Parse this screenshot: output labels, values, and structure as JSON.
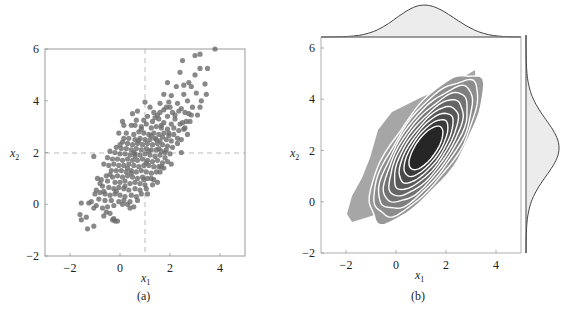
{
  "chart_data": [
    {
      "id": "a",
      "type": "scatter",
      "caption": "(a)",
      "xlabel": "x1",
      "ylabel": "x2",
      "xlim": [
        -3,
        5
      ],
      "ylim": [
        -2,
        6
      ],
      "xticks": [
        -2,
        0,
        2,
        4
      ],
      "yticks": [
        -2,
        0,
        2,
        4,
        6
      ],
      "grid": false,
      "reference_lines": {
        "vertical_x": 1,
        "horizontal_y": 2,
        "style": "dashed"
      },
      "marker_color": "#6b6b6b",
      "points": [
        [
          3.8,
          6.0
        ],
        [
          3.2,
          5.8
        ],
        [
          3.0,
          5.75
        ],
        [
          2.5,
          5.55
        ],
        [
          3.5,
          5.25
        ],
        [
          3.2,
          5.25
        ],
        [
          3.0,
          5.0
        ],
        [
          2.4,
          5.1
        ],
        [
          1.9,
          4.7
        ],
        [
          3.4,
          4.65
        ],
        [
          2.75,
          4.7
        ],
        [
          2.85,
          4.55
        ],
        [
          2.55,
          4.6
        ],
        [
          2.25,
          4.55
        ],
        [
          1.75,
          4.25
        ],
        [
          2.55,
          4.25
        ],
        [
          3.05,
          4.3
        ],
        [
          3.45,
          4.25
        ],
        [
          2.05,
          4.2
        ],
        [
          1.0,
          3.95
        ],
        [
          1.6,
          3.9
        ],
        [
          1.95,
          3.95
        ],
        [
          2.3,
          3.9
        ],
        [
          2.7,
          4.0
        ],
        [
          2.0,
          3.75
        ],
        [
          1.75,
          3.65
        ],
        [
          1.2,
          3.75
        ],
        [
          3.2,
          3.75
        ],
        [
          2.45,
          3.7
        ],
        [
          2.9,
          3.75
        ],
        [
          0.7,
          3.6
        ],
        [
          0.5,
          3.5
        ],
        [
          1.35,
          3.55
        ],
        [
          1.5,
          3.45
        ],
        [
          2.1,
          3.55
        ],
        [
          2.6,
          3.55
        ],
        [
          2.85,
          3.45
        ],
        [
          3.1,
          3.45
        ],
        [
          1.9,
          3.4
        ],
        [
          1.1,
          3.4
        ],
        [
          0.65,
          3.25
        ],
        [
          1.3,
          3.2
        ],
        [
          1.55,
          3.3
        ],
        [
          1.75,
          3.15
        ],
        [
          2.2,
          3.3
        ],
        [
          2.4,
          3.1
        ],
        [
          2.65,
          3.2
        ],
        [
          1.05,
          3.1
        ],
        [
          0.1,
          3.2
        ],
        [
          0.15,
          3.05
        ],
        [
          0.45,
          3.05
        ],
        [
          0.85,
          3.0
        ],
        [
          1.25,
          2.95
        ],
        [
          1.45,
          3.0
        ],
        [
          1.65,
          2.95
        ],
        [
          1.9,
          2.9
        ],
        [
          2.15,
          2.95
        ],
        [
          2.35,
          2.85
        ],
        [
          2.55,
          2.9
        ],
        [
          2.7,
          2.7
        ],
        [
          -0.05,
          2.75
        ],
        [
          0.25,
          2.75
        ],
        [
          0.55,
          2.7
        ],
        [
          0.75,
          2.8
        ],
        [
          0.95,
          2.75
        ],
        [
          1.15,
          2.7
        ],
        [
          1.35,
          2.75
        ],
        [
          1.55,
          2.7
        ],
        [
          1.75,
          2.75
        ],
        [
          1.95,
          2.65
        ],
        [
          2.15,
          2.7
        ],
        [
          2.3,
          2.55
        ],
        [
          0.35,
          2.55
        ],
        [
          0.6,
          2.5
        ],
        [
          0.8,
          2.55
        ],
        [
          1.0,
          2.5
        ],
        [
          1.2,
          2.5
        ],
        [
          1.4,
          2.55
        ],
        [
          1.6,
          2.45
        ],
        [
          1.85,
          2.5
        ],
        [
          2.05,
          2.45
        ],
        [
          2.3,
          2.35
        ],
        [
          2.45,
          2.0
        ],
        [
          0.1,
          2.4
        ],
        [
          0.3,
          2.35
        ],
        [
          0.5,
          2.3
        ],
        [
          0.7,
          2.35
        ],
        [
          0.9,
          2.3
        ],
        [
          1.1,
          2.35
        ],
        [
          1.3,
          2.3
        ],
        [
          1.5,
          2.35
        ],
        [
          1.7,
          2.3
        ],
        [
          1.9,
          2.25
        ],
        [
          2.1,
          2.2
        ],
        [
          -0.15,
          2.2
        ],
        [
          0.05,
          2.15
        ],
        [
          0.25,
          2.15
        ],
        [
          0.45,
          2.1
        ],
        [
          0.65,
          2.15
        ],
        [
          0.85,
          2.1
        ],
        [
          1.05,
          2.15
        ],
        [
          1.25,
          2.1
        ],
        [
          1.45,
          2.1
        ],
        [
          1.65,
          2.05
        ],
        [
          1.85,
          2.1
        ],
        [
          2.0,
          1.95
        ],
        [
          -0.4,
          2.05
        ],
        [
          -0.2,
          2.0
        ],
        [
          0.0,
          1.95
        ],
        [
          0.2,
          1.95
        ],
        [
          0.4,
          1.9
        ],
        [
          0.6,
          1.95
        ],
        [
          0.8,
          1.9
        ],
        [
          1.0,
          1.95
        ],
        [
          1.2,
          1.9
        ],
        [
          1.4,
          1.85
        ],
        [
          1.6,
          1.9
        ],
        [
          1.8,
          1.8
        ],
        [
          -1.05,
          1.85
        ],
        [
          -0.5,
          1.8
        ],
        [
          -0.3,
          1.75
        ],
        [
          -0.1,
          1.75
        ],
        [
          0.1,
          1.7
        ],
        [
          0.3,
          1.75
        ],
        [
          0.5,
          1.7
        ],
        [
          0.7,
          1.7
        ],
        [
          0.9,
          1.75
        ],
        [
          1.1,
          1.7
        ],
        [
          1.3,
          1.65
        ],
        [
          1.5,
          1.7
        ],
        [
          1.7,
          1.6
        ],
        [
          1.9,
          1.65
        ],
        [
          2.05,
          1.55
        ],
        [
          -0.65,
          1.55
        ],
        [
          -0.45,
          1.5
        ],
        [
          -0.25,
          1.55
        ],
        [
          -0.05,
          1.5
        ],
        [
          0.15,
          1.5
        ],
        [
          0.35,
          1.55
        ],
        [
          0.55,
          1.5
        ],
        [
          0.75,
          1.45
        ],
        [
          0.95,
          1.5
        ],
        [
          1.15,
          1.5
        ],
        [
          1.35,
          1.45
        ],
        [
          1.55,
          1.45
        ],
        [
          1.75,
          1.4
        ],
        [
          1.6,
          1.25
        ],
        [
          -0.35,
          1.3
        ],
        [
          -0.15,
          1.3
        ],
        [
          0.05,
          1.3
        ],
        [
          0.25,
          1.25
        ],
        [
          0.45,
          1.3
        ],
        [
          0.65,
          1.25
        ],
        [
          0.85,
          1.3
        ],
        [
          1.05,
          1.25
        ],
        [
          1.25,
          1.2
        ],
        [
          1.45,
          1.25
        ],
        [
          -0.55,
          1.1
        ],
        [
          -0.3,
          1.05
        ],
        [
          -0.1,
          1.1
        ],
        [
          0.1,
          1.05
        ],
        [
          0.3,
          1.1
        ],
        [
          0.5,
          1.05
        ],
        [
          0.7,
          1.0
        ],
        [
          0.9,
          1.05
        ],
        [
          1.1,
          1.0
        ],
        [
          1.35,
          0.95
        ],
        [
          1.5,
          0.85
        ],
        [
          -0.75,
          0.95
        ],
        [
          -0.5,
          0.9
        ],
        [
          -0.2,
          0.85
        ],
        [
          0.0,
          0.85
        ],
        [
          0.2,
          0.9
        ],
        [
          0.4,
          0.8
        ],
        [
          0.6,
          0.85
        ],
        [
          0.8,
          0.8
        ],
        [
          1.0,
          0.75
        ],
        [
          1.3,
          0.75
        ],
        [
          -0.95,
          0.55
        ],
        [
          -0.7,
          0.7
        ],
        [
          -0.45,
          0.65
        ],
        [
          -0.25,
          0.6
        ],
        [
          -0.05,
          0.65
        ],
        [
          0.15,
          0.6
        ],
        [
          0.35,
          0.55
        ],
        [
          0.6,
          0.6
        ],
        [
          0.8,
          0.55
        ],
        [
          1.05,
          0.6
        ],
        [
          0.85,
          0.4
        ],
        [
          -1.0,
          0.4
        ],
        [
          -0.8,
          0.45
        ],
        [
          -0.6,
          0.4
        ],
        [
          -0.4,
          0.35
        ],
        [
          -0.2,
          0.4
        ],
        [
          0.0,
          0.35
        ],
        [
          0.2,
          0.3
        ],
        [
          0.45,
          0.35
        ],
        [
          0.65,
          0.3
        ],
        [
          -0.85,
          0.2
        ],
        [
          -0.6,
          0.15
        ],
        [
          -0.35,
          0.15
        ],
        [
          -0.05,
          0.1
        ],
        [
          0.15,
          0.15
        ],
        [
          0.4,
          0.1
        ],
        [
          0.55,
          -0.1
        ],
        [
          -1.55,
          0.05
        ],
        [
          -1.25,
          0.05
        ],
        [
          -1.15,
          0.1
        ],
        [
          -0.95,
          -0.05
        ],
        [
          -0.7,
          -0.15
        ],
        [
          -0.5,
          -0.1
        ],
        [
          -0.25,
          -0.05
        ],
        [
          0.1,
          0.0
        ],
        [
          0.3,
          0.0
        ],
        [
          -1.05,
          -0.15
        ],
        [
          -0.55,
          -0.3
        ],
        [
          -0.65,
          -0.45
        ],
        [
          -0.4,
          -0.35
        ],
        [
          -1.6,
          -0.4
        ],
        [
          -1.35,
          -0.5
        ],
        [
          -1.55,
          -0.6
        ],
        [
          -0.3,
          -0.6
        ],
        [
          -0.2,
          -0.65
        ],
        [
          -0.1,
          -0.65
        ],
        [
          -0.25,
          -0.55
        ],
        [
          -1.05,
          -0.85
        ],
        [
          -1.3,
          -0.95
        ],
        [
          -0.65,
          0.5
        ],
        [
          1.55,
          2.15
        ],
        [
          1.95,
          2.75
        ],
        [
          2.5,
          3.15
        ],
        [
          2.6,
          2.95
        ],
        [
          2.2,
          3.45
        ],
        [
          1.4,
          3.35
        ],
        [
          0.95,
          3.25
        ],
        [
          0.6,
          3.05
        ],
        [
          1.85,
          3.75
        ],
        [
          2.35,
          3.6
        ],
        [
          2.75,
          3.5
        ],
        [
          1.65,
          3.05
        ],
        [
          0.55,
          2.0
        ],
        [
          1.05,
          1.6
        ],
        [
          0.45,
          1.2
        ],
        [
          0.2,
          0.7
        ],
        [
          -0.15,
          0.5
        ],
        [
          1.25,
          1.0
        ],
        [
          1.65,
          1.45
        ],
        [
          0.75,
          2.45
        ],
        [
          1.25,
          2.65
        ],
        [
          1.8,
          2.0
        ],
        [
          0.95,
          0.95
        ],
        [
          0.3,
          1.4
        ],
        [
          0.6,
          1.85
        ],
        [
          1.15,
          2.05
        ],
        [
          1.45,
          2.5
        ],
        [
          0.85,
          2.9
        ],
        [
          1.6,
          3.55
        ],
        [
          2.05,
          3.1
        ],
        [
          2.45,
          2.5
        ],
        [
          0.0,
          2.3
        ],
        [
          -0.4,
          1.15
        ],
        [
          -0.8,
          0.8
        ],
        [
          0.7,
          0.15
        ],
        [
          1.1,
          0.4
        ],
        [
          0.4,
          -0.15
        ],
        [
          -0.9,
          1.0
        ],
        [
          0.15,
          2.55
        ],
        [
          1.7,
          2.6
        ],
        [
          2.8,
          3.2
        ],
        [
          3.25,
          4.0
        ]
      ]
    },
    {
      "id": "b",
      "type": "heatmap",
      "subtype": "kde_contour_jointplot",
      "caption": "(b)",
      "xlabel": "x1",
      "ylabel": "x2",
      "xlim": [
        -3,
        5
      ],
      "ylim": [
        -2,
        6
      ],
      "xticks": [
        -2,
        0,
        2,
        4
      ],
      "yticks": [
        -2,
        0,
        2,
        4,
        6
      ],
      "grid": false,
      "density_center": [
        1.2,
        2.1
      ],
      "contour_levels": 10,
      "contour_line_color": "#ffffff",
      "fill_colors": [
        "#a6a6a6",
        "#999999",
        "#8c8c8c",
        "#7f7f7f",
        "#727272",
        "#656565",
        "#585858",
        "#4a4a4a",
        "#3a3a3a",
        "#262626"
      ],
      "marginal_x": {
        "peak_x": 1.1,
        "fill": "#ebebeb",
        "line": "#444444"
      },
      "marginal_y": {
        "peak_y": 2.1,
        "fill": "#ebebeb",
        "line": "#444444"
      }
    }
  ],
  "labels": {
    "a": {
      "x": "x",
      "x_sub": "1",
      "y": "x",
      "y_sub": "2",
      "caption": "(a)"
    },
    "b": {
      "x": "x",
      "x_sub": "1",
      "y": "x",
      "y_sub": "2",
      "caption": "(b)"
    },
    "xticks": [
      "−2",
      "0",
      "2",
      "4"
    ],
    "yticks": [
      "6",
      "4",
      "2",
      "0",
      "−2"
    ]
  }
}
